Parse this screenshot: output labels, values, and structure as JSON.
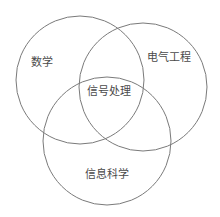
{
  "diagram": {
    "type": "venn",
    "sets": [
      {
        "id": "math",
        "label": "数学",
        "cx": 80,
        "cy": 80,
        "r": 64,
        "label_x": 42,
        "label_y": 62
      },
      {
        "id": "electrical-engineering",
        "label": "电气工程",
        "cx": 143,
        "cy": 87,
        "r": 64,
        "label_x": 169,
        "label_y": 57
      },
      {
        "id": "information-science",
        "label": "信息科学",
        "cx": 107,
        "cy": 141,
        "r": 64,
        "label_x": 107,
        "label_y": 174
      }
    ],
    "intersection": {
      "id": "signal-processing",
      "label": "信号处理",
      "label_x": 109,
      "label_y": 91
    },
    "stroke_color": "#7a7a7a",
    "text_color": "#4a4a4a",
    "background": "#ffffff"
  }
}
